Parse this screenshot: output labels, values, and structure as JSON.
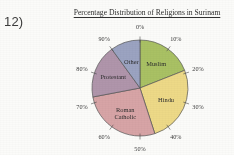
{
  "worksheet": {
    "question_number": "12)"
  },
  "chart_data": {
    "type": "pie",
    "title": "Percentage Distribution of Religions in Surinam",
    "categories": [
      "Muslim",
      "Hindu",
      "Roman Catholic",
      "Protestant",
      "Other"
    ],
    "values": [
      19,
      26,
      27,
      18,
      10
    ],
    "labels": [
      "Muslim",
      "Hindu",
      "Roman\nCatholic",
      "Protestant",
      "Other"
    ],
    "colors": [
      "#a9c45c",
      "#f2dc80",
      "#dda4a6",
      "#b395ae",
      "#9ba4c6"
    ],
    "start_angle_deg": 0,
    "direction": "clockwise",
    "axis_ticks": [
      "0%",
      "10%",
      "20%",
      "30%",
      "40%",
      "50%",
      "60%",
      "70%",
      "80%",
      "90%"
    ],
    "tick_interval_percent": 10,
    "grid": false,
    "legend": "none",
    "xlabel": "",
    "ylabel": "",
    "outline_color": "#555555"
  }
}
